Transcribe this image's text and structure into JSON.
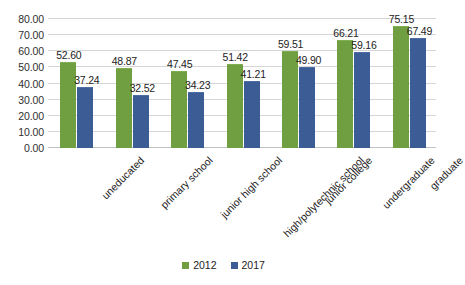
{
  "chart_data": {
    "type": "bar",
    "title": "",
    "subtitle": "",
    "xlabel": "",
    "ylabel": "",
    "ylim": [
      0,
      80
    ],
    "ytick_step": 10,
    "ytick_labels": [
      "0.00",
      "10.00",
      "20.00",
      "30.00",
      "40.00",
      "50.00",
      "60.00",
      "70.00",
      "80.00"
    ],
    "grid": true,
    "legend_position": "bottom",
    "categories": [
      "uneducated",
      "primary school",
      "junior high school",
      "high/polytechnic school",
      "junior college",
      "undergraduate",
      "graduate"
    ],
    "series": [
      {
        "name": "2012",
        "color": "#6f9f40",
        "values": [
          52.6,
          48.87,
          47.45,
          51.42,
          59.51,
          66.21,
          75.15
        ],
        "labels": [
          "52.60",
          "48.87",
          "47.45",
          "51.42",
          "59.51",
          "66.21",
          "75.15"
        ]
      },
      {
        "name": "2017",
        "color": "#3c5c96",
        "values": [
          37.24,
          32.52,
          34.23,
          41.21,
          49.9,
          59.16,
          67.49
        ],
        "labels": [
          "37.24",
          "32.52",
          "34.23",
          "41.21",
          "49.90",
          "59.16",
          "67.49"
        ]
      }
    ]
  },
  "legend": {
    "items": [
      {
        "label": "2012",
        "color": "#6f9f40"
      },
      {
        "label": "2017",
        "color": "#3c5c96"
      }
    ]
  },
  "colors": {
    "series_2012": "#6f9f40",
    "series_2017": "#3c5c96",
    "gridline": "#d6d6d6",
    "background": "#ffffff",
    "text": "#232323"
  }
}
